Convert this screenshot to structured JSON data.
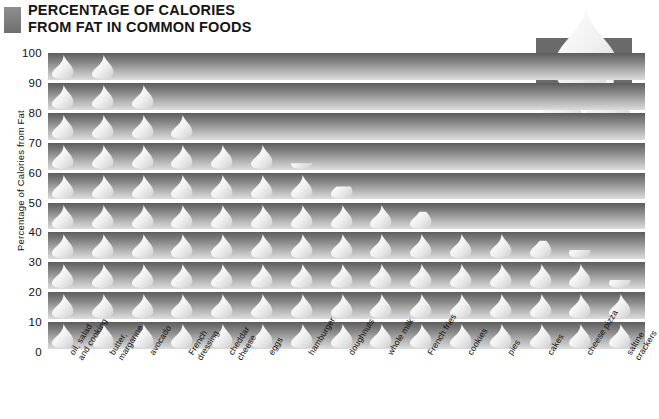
{
  "title": {
    "line1": "PERCENTAGE OF CALORIES",
    "line2": "FROM FAT IN COMMON FOODS",
    "bullet_icon": "gray-square-icon"
  },
  "logo": {
    "icon": "fat-droplets-icon",
    "panel_color": "#6a6a6a",
    "droplet_color": "#f2f2f2"
  },
  "colors": {
    "band_top": "#5d5d5d",
    "band_bottom": "#dcdcdc",
    "droplet": "#f4f4f4",
    "text": "#111111",
    "background": "#ffffff"
  },
  "chart_data": {
    "type": "bar",
    "title": "PERCENTAGE OF CALORIES FROM FAT IN COMMON FOODS",
    "subtitle": "",
    "xlabel": "",
    "ylabel": "Percentage of Calories from Fat",
    "ylim": [
      0,
      100
    ],
    "yticks": [
      0,
      10,
      20,
      30,
      40,
      50,
      60,
      70,
      80,
      90,
      100
    ],
    "ytick_labels": [
      "0",
      "10",
      "20",
      "30",
      "40",
      "50",
      "60",
      "70",
      "80",
      "90",
      "100"
    ],
    "grid": false,
    "legend": "none",
    "units": "percent",
    "marker_style": "droplet-pictogram",
    "categories": [
      "oil, salad and cooking",
      "butter, margarine",
      "avocado",
      "French dressing",
      "cheddar cheese",
      "eggs",
      "hamburger",
      "doughnuts",
      "whole milk",
      "French fries",
      "cookies",
      "pies",
      "cakes",
      "cheese pizza",
      "saltine crackers"
    ],
    "categories_display": [
      [
        "oil, salad",
        "and cooking"
      ],
      [
        "butter,",
        "margarine"
      ],
      [
        "avocado"
      ],
      [
        "French",
        "dressing"
      ],
      [
        "cheddar",
        "cheese"
      ],
      [
        "eggs"
      ],
      [
        "hamburger"
      ],
      [
        "doughnuts"
      ],
      [
        "whole milk"
      ],
      [
        "French fries"
      ],
      [
        "cookies"
      ],
      [
        "pies"
      ],
      [
        "cakes"
      ],
      [
        "cheese pizza"
      ],
      [
        "saltine",
        "crackers"
      ]
    ],
    "values": [
      100,
      100,
      90,
      80,
      70,
      70,
      62,
      55,
      50,
      47,
      40,
      40,
      37,
      33,
      23
    ]
  }
}
